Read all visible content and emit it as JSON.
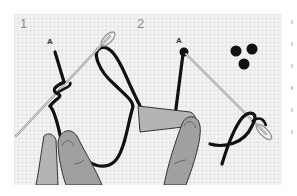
{
  "illustration": {
    "background_color": "#f4f4f4",
    "grid_color": "#e6e6e6",
    "thread_color": "#111111",
    "needle_color": "#cfcfcf",
    "skin_color": "#a8a8a8",
    "panels": [
      {
        "step": "1",
        "point_label": "A",
        "description": "thread wrapped around needle"
      },
      {
        "step": "2",
        "point_label": "A",
        "description": "needle inserted back near point A forming knot",
        "knot_count": 3
      }
    ]
  }
}
